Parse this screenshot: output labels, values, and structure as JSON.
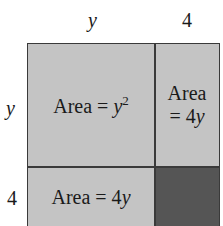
{
  "diagram": {
    "type": "area-model-square",
    "top_labels": {
      "left": "y",
      "right": "4"
    },
    "side_labels": {
      "top": "y",
      "bottom": "4"
    },
    "cells": {
      "top_left": {
        "prefix": "Area = ",
        "var": "y",
        "exp": "2"
      },
      "top_right": {
        "line1": "Area",
        "line2_prefix": "= 4",
        "line2_var": "y"
      },
      "bottom_left": {
        "prefix": "Area = 4",
        "var": "y"
      },
      "bottom_right": {
        "text": ""
      }
    },
    "colors": {
      "light_fill": "#c4c4c4",
      "dark_fill": "#555555",
      "border": "#3a3a3a"
    }
  }
}
